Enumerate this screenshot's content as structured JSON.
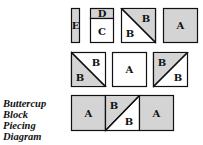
{
  "caption": {
    "lines": [
      "Buttercup",
      "Block",
      "Piecing",
      "Diagram"
    ]
  },
  "colors": {
    "shaded": "#d4d4d4",
    "white": "#ffffff",
    "stroke": "#111111"
  },
  "pieces": {
    "row1": {
      "strip": "E",
      "top_small": "D",
      "bottom_large": "C",
      "triangle_upper": "B",
      "triangle_lower": "B",
      "square": "A"
    },
    "row2": {
      "left_upper": "B",
      "left_lower": "B",
      "center": "A",
      "right_upper": "B",
      "right_lower": "B"
    },
    "row3": {
      "left": "A",
      "mid_upper": "B",
      "mid_lower": "B",
      "right": "A"
    }
  }
}
